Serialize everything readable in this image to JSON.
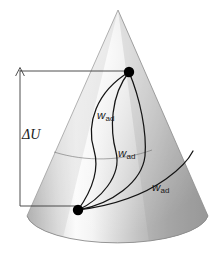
{
  "figure": {
    "type": "diagram",
    "background_color": "#ffffff",
    "canvas": {
      "width": 219,
      "height": 259
    }
  },
  "labels": {
    "energy_change": {
      "symbol": "Δ",
      "variable": "U",
      "text": "ΔU"
    },
    "work_1": {
      "base": "w",
      "subscript": "ad",
      "text": "wad"
    },
    "work_2": {
      "base": "w",
      "subscript": "ad",
      "text": "wad"
    },
    "work_3": {
      "base": "w",
      "subscript": "ad",
      "text": "wad"
    }
  },
  "geometry": {
    "cone": {
      "apex": [
        118,
        10
      ],
      "base_center": [
        117,
        216
      ],
      "base_rx": 91,
      "base_ry": 30,
      "left_base": [
        27,
        216
      ],
      "right_base": [
        208,
        216
      ]
    },
    "state_points": [
      {
        "name": "initial-state-point",
        "x": 77,
        "y": 210,
        "r": 5.2
      },
      {
        "name": "final-state-point",
        "x": 129,
        "y": 72,
        "r": 5.2
      }
    ],
    "bracket": {
      "arrow_tip": [
        20,
        68
      ],
      "vertical_bottom": [
        20,
        206
      ],
      "top_horizontal_end": [
        129,
        72
      ],
      "bottom_horizontal_end": [
        78,
        210
      ]
    }
  },
  "colors": {
    "cone_light": "#fdfdfd",
    "cone_mid": "#d6d6d6",
    "cone_dark": "#9b9b9b",
    "cone_edge": "#8d8d8d",
    "curve": "#141414",
    "point": "#000000",
    "bracket": "#3a3a3a",
    "text": "#1a1a1a"
  },
  "paths": {
    "work_curve_1": "M129,72 C 96,92 86,124 94,150 C 101,174 88,196 78,210",
    "work_curve_2": "M129,72 C 110,96 110,130 116,152 C 122,176 100,200 78,210",
    "work_curve_3": "M129,72 C 140,98 147,132 145,156 C 142,182 112,204 78,210",
    "work_curve_4": "M78,210 C 110,206 142,196 166,179 C 180,169 188,160 192,152",
    "surface_contour": "M54,152 C 86,162 122,161 152,150"
  }
}
